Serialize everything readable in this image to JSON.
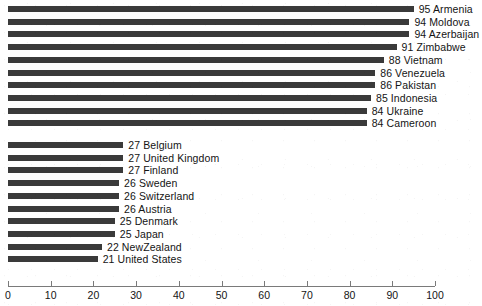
{
  "chart_data": {
    "type": "bar",
    "orientation": "horizontal",
    "title": "",
    "subtitle": "",
    "xlabel": "",
    "ylabel": "",
    "xlim": [
      0,
      100
    ],
    "grid": false,
    "legend": null,
    "bar_color": "#3a3a3a",
    "axis_color": "#7a7a7a",
    "text_color": "#141414",
    "xticks": [
      0,
      10,
      20,
      30,
      40,
      50,
      60,
      70,
      80,
      90,
      100
    ],
    "xtick_labels": [
      "0",
      "10",
      "20",
      "30",
      "40",
      "50",
      "60",
      "70",
      "80",
      "90",
      "100"
    ],
    "categories": [
      "Armenia",
      "Moldova",
      "Azerbaijan",
      "Zimbabwe",
      "Vietnam",
      "Venezuela",
      "Pakistan",
      "Indonesia",
      "Ukraine",
      "Cameroon",
      "Belgium",
      "United Kingdom",
      "Finland",
      "Sweden",
      "Switzerland",
      "Austria",
      "Denmark",
      "Japan",
      "NewZealand",
      "United States"
    ],
    "values": [
      95,
      94,
      94,
      91,
      88,
      86,
      86,
      85,
      84,
      84,
      27,
      27,
      27,
      26,
      26,
      26,
      25,
      25,
      22,
      21
    ],
    "bars": [
      {
        "value": 95,
        "category": "Armenia",
        "label": "95 Armenia",
        "group": 1
      },
      {
        "value": 94,
        "category": "Moldova",
        "label": "94 Moldova",
        "group": 1
      },
      {
        "value": 94,
        "category": "Azerbaijan",
        "label": "94 Azerbaijan",
        "group": 1
      },
      {
        "value": 91,
        "category": "Zimbabwe",
        "label": "91 Zimbabwe",
        "group": 1
      },
      {
        "value": 88,
        "category": "Vietnam",
        "label": "88 Vietnam",
        "group": 1
      },
      {
        "value": 86,
        "category": "Venezuela",
        "label": "86 Venezuela",
        "group": 1
      },
      {
        "value": 86,
        "category": "Pakistan",
        "label": "86 Pakistan",
        "group": 1
      },
      {
        "value": 85,
        "category": "Indonesia",
        "label": "85 Indonesia",
        "group": 1
      },
      {
        "value": 84,
        "category": "Ukraine",
        "label": "84 Ukraine",
        "group": 1
      },
      {
        "value": 84,
        "category": "Cameroon",
        "label": "84 Cameroon",
        "group": 1
      },
      {
        "value": 27,
        "category": "Belgium",
        "label": "27 Belgium",
        "group": 2
      },
      {
        "value": 27,
        "category": "United Kingdom",
        "label": "27 United Kingdom",
        "group": 2
      },
      {
        "value": 27,
        "category": "Finland",
        "label": "27 Finland",
        "group": 2
      },
      {
        "value": 26,
        "category": "Sweden",
        "label": "26 Sweden",
        "group": 2
      },
      {
        "value": 26,
        "category": "Switzerland",
        "label": "26 Switzerland",
        "group": 2
      },
      {
        "value": 26,
        "category": "Austria",
        "label": "26 Austria",
        "group": 2
      },
      {
        "value": 25,
        "category": "Denmark",
        "label": "25 Denmark",
        "group": 2
      },
      {
        "value": 25,
        "category": "Japan",
        "label": "25 Japan",
        "group": 2
      },
      {
        "value": 22,
        "category": "NewZealand",
        "label": "22 NewZealand",
        "group": 2
      },
      {
        "value": 21,
        "category": "United States",
        "label": "21 United States",
        "group": 2
      }
    ]
  },
  "layout": {
    "plot_left_px": 8,
    "plot_right_px": 435,
    "first_bar_top_px": 6,
    "row_pitch_px": 12.7,
    "bar_height_px": 6,
    "group_gap_px": 9,
    "label_offset_px": 5
  }
}
